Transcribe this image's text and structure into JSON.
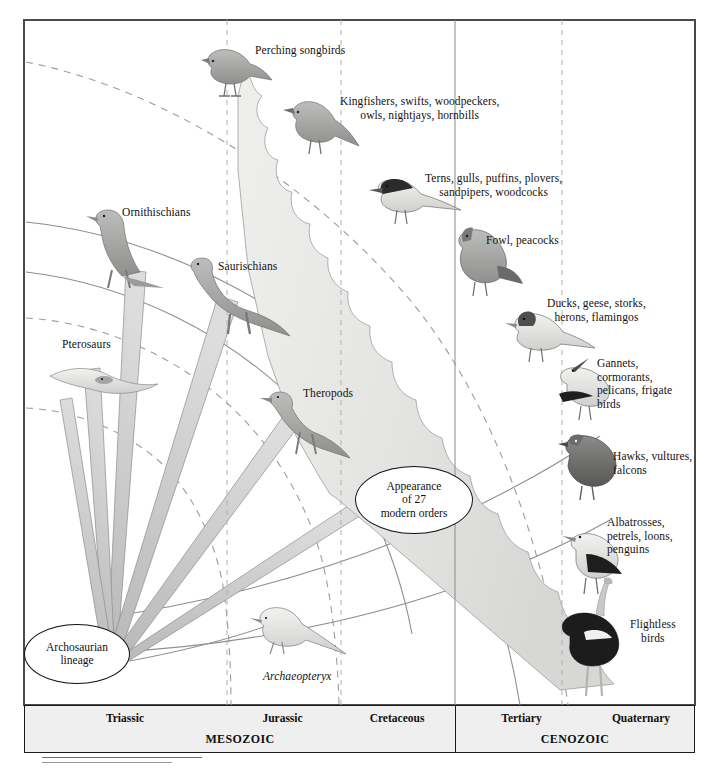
{
  "figure": {
    "title_visible": false,
    "type": "evolutionary-phylogeny-diagram",
    "frame": {
      "border_color": "#4a4a4a"
    }
  },
  "nodes": {
    "archosaurian": {
      "label": "Archosaurian\nlineage"
    },
    "modern_orders": {
      "label": "Appearance\nof 27\nmodern orders"
    }
  },
  "labels": {
    "perching_songbirds": "Perching songbirds",
    "kingfishers": "Kingfishers, swifts, woodpeckers,\nowls, nightjays, hornbills",
    "terns": "Terns, gulls, puffins, plovers,\nsandpipers, woodcocks",
    "fowl": "Fowl, peacocks",
    "ducks": "Ducks, geese, storks,\nherons, flamingos",
    "gannets": "Gannets,\ncormorants,\npelicans, frigate\nbirds",
    "hawks": "Hawks, vultures,\nfalcons",
    "albatrosses": "Albatrosses,\npetrels, loons,\npenguins",
    "flightless": "Flightless\nbirds",
    "ornithischians": "Ornithischians",
    "saurischians": "Saurischians",
    "pterosaurs": "Pterosaurs",
    "theropods": "Theropods",
    "archaeopteryx": "Archaeopteryx"
  },
  "timeline": {
    "eras": [
      {
        "name": "MESOZOIC",
        "periods": [
          "Triassic",
          "Jurassic",
          "Cretaceous"
        ]
      },
      {
        "name": "CENOZOIC",
        "periods": [
          "Tertiary",
          "Quaternary"
        ]
      }
    ],
    "era_mesozoic": "MESOZOIC",
    "era_cenozoic": "CENOZOIC",
    "triassic": "Triassic",
    "jurassic": "Jurassic",
    "cretaceous": "Cretaceous",
    "tertiary": "Tertiary",
    "quaternary": "Quaternary"
  },
  "colors": {
    "frame": "#4a4a4a",
    "timeline_fill": "#efefef",
    "timeline_border": "#1b1b1b",
    "fan_fill": "#e2e2e0",
    "branch_fill": "#c9c9c9",
    "arc_stroke": "#8e8e8e",
    "dashed_stroke": "#9a9a9a",
    "text": "#14110f"
  }
}
